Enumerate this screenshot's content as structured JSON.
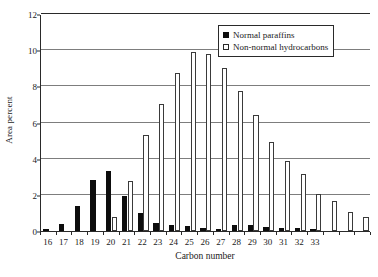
{
  "chart_data": {
    "type": "bar",
    "title": "",
    "xlabel": "Carbon number",
    "ylabel": "Area percent",
    "ylim": [
      0,
      12
    ],
    "yticks": [
      0,
      2,
      4,
      6,
      8,
      10,
      12
    ],
    "ytick_labels": [
      "0",
      "2",
      "4",
      "6",
      "8",
      "10",
      "12"
    ],
    "grid": "horizontal",
    "legend_position": "top-right",
    "categories": [
      "16",
      "17",
      "18",
      "19",
      "20",
      "21",
      "22",
      "23",
      "24",
      "25",
      "26",
      "27",
      "28",
      "29",
      "30",
      "31",
      "32",
      "33",
      "",
      "",
      ""
    ],
    "xtick_labels": [
      "16",
      "17",
      "18",
      "19",
      "20",
      "21",
      "22",
      "23",
      "24",
      "25",
      "26",
      "27",
      "28",
      "29",
      "30",
      "31",
      "32",
      "33"
    ],
    "series": [
      {
        "name": "Normal paraffins",
        "color": "#0d0d0d",
        "fill": "solid",
        "values": [
          0.05,
          0.4,
          1.4,
          2.8,
          3.3,
          1.95,
          1.0,
          0.45,
          0.35,
          0.28,
          0.18,
          0.1,
          0.35,
          0.35,
          0.2,
          0.18,
          0.18,
          0.08,
          0,
          0,
          0
        ]
      },
      {
        "name": "Non-normal hydrocarbons",
        "color": "#ffffff",
        "fill": "open",
        "values": [
          0,
          0,
          0,
          0,
          0.75,
          2.75,
          5.3,
          7.05,
          8.75,
          9.9,
          9.8,
          9.0,
          7.75,
          6.4,
          4.95,
          3.85,
          3.15,
          2.05,
          1.65,
          1.05,
          0.75
        ]
      }
    ]
  },
  "legend": {
    "entries": [
      {
        "label": "Normal paraffins",
        "marker": "filled-square-icon"
      },
      {
        "label": "Non-normal hydrocarbons",
        "marker": "open-square-icon"
      }
    ]
  },
  "axes": {
    "y_title": "Area percent",
    "x_title": "Carbon number"
  }
}
